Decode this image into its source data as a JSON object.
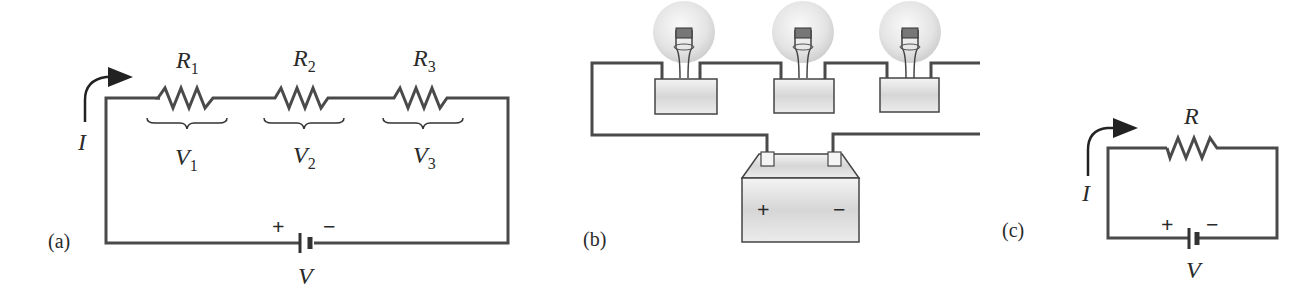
{
  "panels": {
    "a": {
      "label": "(a)",
      "current": "I",
      "resistors": [
        {
          "name": "R",
          "sub": "1",
          "voltage": "V",
          "vsub": "1"
        },
        {
          "name": "R",
          "sub": "2",
          "voltage": "V",
          "vsub": "2"
        },
        {
          "name": "R",
          "sub": "3",
          "voltage": "V",
          "vsub": "3"
        }
      ],
      "battery": {
        "plus": "+",
        "minus": "−",
        "voltage": "V"
      }
    },
    "b": {
      "label": "(b)",
      "bulbs": 3,
      "battery": {
        "plus": "+",
        "minus": "−"
      }
    },
    "c": {
      "label": "(c)",
      "current": "I",
      "resistor": "R",
      "battery": {
        "plus": "+",
        "minus": "−",
        "voltage": "V"
      }
    }
  },
  "colors": {
    "wire": "#4a4a4a",
    "text": "#2a2a2a",
    "fill_gray": "#d8d8d8"
  }
}
